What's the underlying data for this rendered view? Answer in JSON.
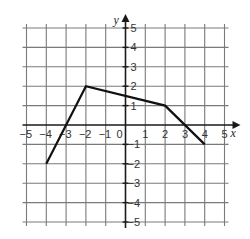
{
  "chart_data": {
    "type": "line",
    "title": "",
    "xlabel": "x",
    "ylabel": "y",
    "xlim": [
      -5,
      5
    ],
    "ylim": [
      -5,
      5
    ],
    "grid": true,
    "x_ticks": [
      -5,
      -4,
      -3,
      -2,
      -1,
      0,
      1,
      2,
      3,
      4,
      5
    ],
    "y_ticks": [
      -5,
      -4,
      -3,
      -2,
      -1,
      1,
      2,
      3,
      4,
      5
    ],
    "series": [
      {
        "name": "piecewise linear function",
        "points": [
          [
            -4,
            -2
          ],
          [
            -2,
            2
          ],
          [
            2,
            1
          ],
          [
            4,
            -1
          ]
        ]
      }
    ],
    "x_intercepts": [
      -3,
      3
    ],
    "y_intercept": 1.5
  },
  "colors": {
    "grid": "#7a7a7a",
    "axis": "#1a1a1a",
    "line": "#111111",
    "background": "#ffffff"
  }
}
